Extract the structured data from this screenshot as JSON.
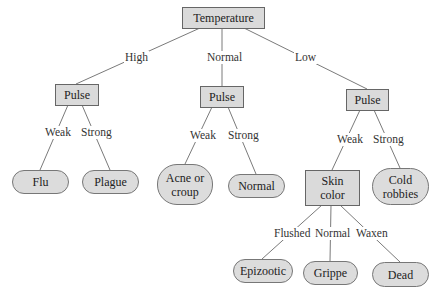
{
  "diagram": {
    "type": "decision-tree",
    "root": {
      "label": "Temperature",
      "shape": "rect"
    },
    "branches": {
      "high": {
        "edge_label": "High",
        "node": "Pulse",
        "children": [
          {
            "edge_label": "Weak",
            "leaf": "Flu"
          },
          {
            "edge_label": "Strong",
            "leaf": "Plague"
          }
        ]
      },
      "normal": {
        "edge_label": "Normal",
        "node": "Pulse",
        "children": [
          {
            "edge_label": "Weak",
            "leaf_line1": "Acne or",
            "leaf_line2": "croup"
          },
          {
            "edge_label": "Strong",
            "leaf": "Normal"
          }
        ]
      },
      "low": {
        "edge_label": "Low",
        "node": "Pulse",
        "children": [
          {
            "edge_label": "Weak",
            "node_line1": "Skin",
            "node_line2": "color",
            "children": [
              {
                "edge_label": "Flushed",
                "leaf": "Epizootic"
              },
              {
                "edge_label": "Normal",
                "leaf": "Grippe"
              },
              {
                "edge_label": "Waxen",
                "leaf": "Dead"
              }
            ]
          },
          {
            "edge_label": "Strong",
            "leaf_line1": "Cold",
            "leaf_line2": "robbies"
          }
        ]
      }
    },
    "colors": {
      "node_fill": "#dadada",
      "node_border": "#666666",
      "edge": "#777777",
      "background": "#ffffff"
    }
  }
}
